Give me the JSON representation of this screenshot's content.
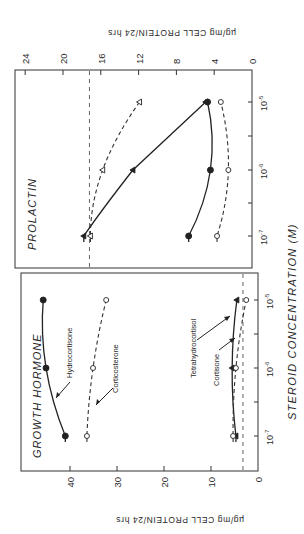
{
  "chart_data": [
    {
      "type": "line",
      "title": "PROLACTIN",
      "xlabel": "STEROID CONCENTRATION (M)",
      "ylabel": "µg/mg CELL PROTEIN/24 hrs",
      "x": [
        "10^-7",
        "10^-6",
        "10^-5"
      ],
      "x_tick_labels": [
        "10-7",
        "10-6",
        "10-5"
      ],
      "x_scale": "log",
      "ylim": [
        0,
        24
      ],
      "y_ticks": [
        0,
        4,
        8,
        12,
        16,
        20,
        24
      ],
      "grid": false,
      "control_level": 17.2,
      "series": [
        {
          "name": "Hydrocortisone",
          "marker": "filled-circle",
          "line": "solid",
          "values": [
            6.7,
            4.4,
            4.7
          ]
        },
        {
          "name": "Tetrahydrocortisol",
          "marker": "filled-triangle",
          "line": "solid",
          "values": [
            17.8,
            12.6,
            4.9
          ]
        },
        {
          "name": "Corticosterone",
          "marker": "open-triangle",
          "line": "dashed",
          "values": [
            17.1,
            15.8,
            11.9
          ]
        },
        {
          "name": "Cortisone",
          "marker": "open-circle",
          "line": "dashed",
          "values": [
            3.7,
            2.5,
            3.3
          ]
        }
      ]
    },
    {
      "type": "line",
      "title": "GROWTH HORMONE",
      "xlabel": "STEROID CONCENTRATION (M)",
      "ylabel": "µg/mg CELL PROTEIN/24 hrs",
      "x": [
        "10^-7",
        "10^-6",
        "10^-5"
      ],
      "x_tick_labels": [
        "10-7",
        "10-6",
        "10-5"
      ],
      "x_scale": "log",
      "ylim": [
        0,
        48
      ],
      "y_ticks": [
        0,
        10,
        20,
        30,
        40
      ],
      "grid": false,
      "control_level": 3.2,
      "series": [
        {
          "name": "Hydrocortisone",
          "marker": "filled-circle",
          "line": "solid",
          "values": [
            41,
            45.1,
            45.7
          ]
        },
        {
          "name": "Corticosterone",
          "marker": "open-circle",
          "line": "dashed",
          "values": [
            36.4,
            35.1,
            32.3
          ]
        },
        {
          "name": "Tetrahydrocortisol",
          "marker": "filled-triangle",
          "line": "solid",
          "values": [
            4.7,
            5.5,
            4.5
          ]
        },
        {
          "name": "Cortisone",
          "marker": "open-circle",
          "line": "dashed",
          "values": [
            5.3,
            4.7,
            2.5
          ]
        }
      ],
      "annotations": [
        "Hydrocortisone",
        "Corticosterone",
        "Tetrahydrocortisol",
        "Cortisone"
      ]
    }
  ],
  "labels": {
    "top_panel_title": "PROLACTIN",
    "bottom_panel_title": "GROWTH HORMONE",
    "x_axis_title": "STEROID CONCENTRATION (M)",
    "y_axis_title_top": "µg/mg CELL PROTEIN/24 hrs",
    "y_axis_title_bottom": "µg/mg CELL PROTEIN/24 hrs",
    "x_tick_base": "10",
    "x_tick_exps": [
      "-7",
      "-6",
      "-5"
    ],
    "bottom_annotations": {
      "hydrocortisone": "Hydrocortisone",
      "corticosterone": "Corticosterone",
      "tetrahydrocortisol": "Tetrahydrocortisol",
      "cortisone": "Cortisone"
    }
  }
}
